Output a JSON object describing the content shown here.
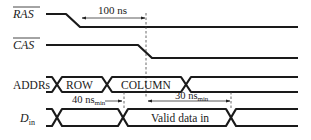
{
  "diagram": {
    "type": "timing-diagram",
    "signals": [
      {
        "id": "ras",
        "label": "RAS",
        "active_low": true
      },
      {
        "id": "cas",
        "label": "CAS",
        "active_low": true
      },
      {
        "id": "addrs",
        "label": "ADDRs"
      },
      {
        "id": "din",
        "label": "D",
        "subscript": "in"
      }
    ],
    "bus_labels": {
      "addrs_row": "ROW",
      "addrs_column": "COLUMN",
      "din_valid": "Valid data in"
    },
    "annotations": {
      "ras_to_cas": "100 ns",
      "setup": {
        "value": "40 ns",
        "subscript": "min"
      },
      "hold": {
        "value": "30 ns",
        "subscript": "min"
      }
    },
    "colors": {
      "line": "#1a1a1a",
      "background": "#ffffff"
    }
  }
}
